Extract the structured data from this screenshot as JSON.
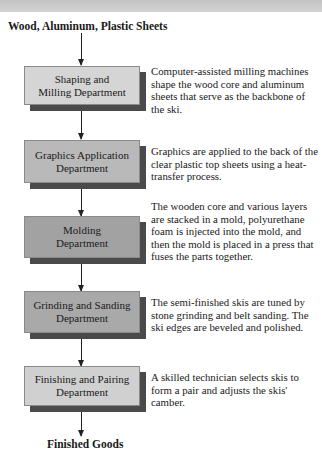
{
  "diagram": {
    "input_label": "Wood, Aluminum, Plastic Sheets",
    "output_label": "Finished Goods",
    "colors": {
      "top_band": "#c8c8c8",
      "shadow": "#4a4a4a",
      "arrow": "#222222"
    },
    "steps": [
      {
        "department": "Shaping and Milling Department",
        "department_lines": [
          "Shaping and",
          "Milling Department"
        ],
        "fill": "#d5d5d5",
        "description": "Computer-assisted milling machines shape the wood core and aluminum sheets that serve as the backbone of the ski."
      },
      {
        "department": "Graphics Application Department",
        "department_lines": [
          "Graphics Application",
          "Department"
        ],
        "fill": "#b9b9b9",
        "description": "Graphics are applied to the back of the clear plastic top sheets using a heat-transfer process."
      },
      {
        "department": "Molding Department",
        "department_lines": [
          "Molding",
          "Department"
        ],
        "fill": "#a2a2a2",
        "description": "The wooden core and various layers are stacked in a mold, polyurethane foam is injected into the mold, and then the mold is placed in a press that fuses the parts together."
      },
      {
        "department": "Grinding and Sanding Department",
        "department_lines": [
          "Grinding and Sanding",
          "Department"
        ],
        "fill": "#a9a9a9",
        "description": "The semi-finished skis are tuned by stone grinding and belt sanding. The ski edges are beveled and polished."
      },
      {
        "department": "Finishing and Pairing Department",
        "department_lines": [
          "Finishing and Pairing",
          "Department"
        ],
        "fill": "#d0d0d0",
        "description": "A skilled technician selects skis to form a pair and adjusts the skis' camber."
      }
    ]
  }
}
